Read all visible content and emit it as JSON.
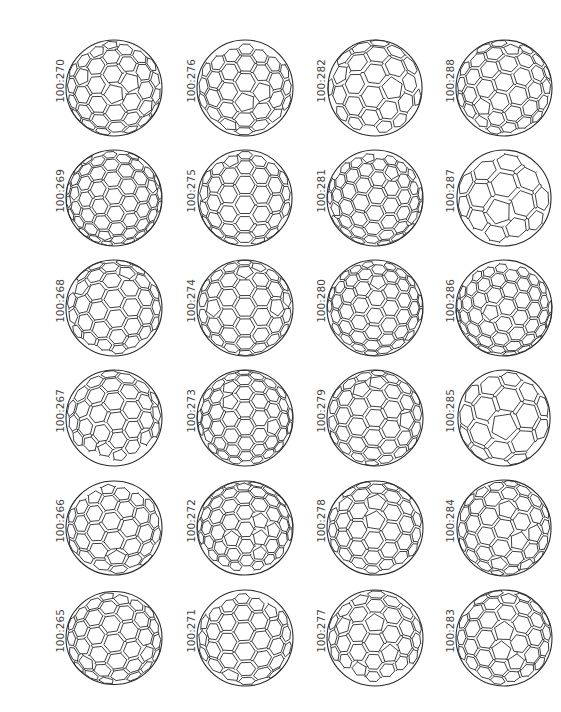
{
  "figure": {
    "title": "",
    "layout": {
      "columns": 4,
      "rows": 6
    },
    "line_color": "#2a2a2a",
    "label_color": "#444444",
    "cells": [
      {
        "label": "100:270",
        "col": 0,
        "row": 0,
        "seed": 270,
        "rx": 1.0,
        "ry": 1.0,
        "density": 7
      },
      {
        "label": "100:269",
        "col": 0,
        "row": 1,
        "seed": 269,
        "rx": 1.0,
        "ry": 1.0,
        "density": 8
      },
      {
        "label": "100:268",
        "col": 0,
        "row": 2,
        "seed": 268,
        "rx": 1.0,
        "ry": 1.0,
        "density": 7
      },
      {
        "label": "100:267",
        "col": 0,
        "row": 3,
        "seed": 267,
        "rx": 1.0,
        "ry": 1.0,
        "density": 7
      },
      {
        "label": "100:266",
        "col": 0,
        "row": 4,
        "seed": 266,
        "rx": 1.0,
        "ry": 0.98,
        "density": 7
      },
      {
        "label": "100:265",
        "col": 0,
        "row": 5,
        "seed": 265,
        "rx": 1.0,
        "ry": 0.97,
        "density": 7
      },
      {
        "label": "100:276",
        "col": 1,
        "row": 0,
        "seed": 276,
        "rx": 1.0,
        "ry": 1.0,
        "density": 7
      },
      {
        "label": "100:275",
        "col": 1,
        "row": 1,
        "seed": 275,
        "rx": 0.98,
        "ry": 1.0,
        "density": 7
      },
      {
        "label": "100:274",
        "col": 1,
        "row": 2,
        "seed": 274,
        "rx": 1.0,
        "ry": 1.0,
        "density": 7
      },
      {
        "label": "100:273",
        "col": 1,
        "row": 3,
        "seed": 273,
        "rx": 1.0,
        "ry": 1.0,
        "density": 8
      },
      {
        "label": "100:272",
        "col": 1,
        "row": 4,
        "seed": 272,
        "rx": 1.0,
        "ry": 0.98,
        "density": 8
      },
      {
        "label": "100:271",
        "col": 1,
        "row": 5,
        "seed": 271,
        "rx": 1.0,
        "ry": 1.0,
        "density": 7
      },
      {
        "label": "100:282",
        "col": 2,
        "row": 0,
        "seed": 282,
        "rx": 0.98,
        "ry": 1.0,
        "density": 6
      },
      {
        "label": "100:281",
        "col": 2,
        "row": 1,
        "seed": 281,
        "rx": 1.0,
        "ry": 1.0,
        "density": 8
      },
      {
        "label": "100:280",
        "col": 2,
        "row": 2,
        "seed": 280,
        "rx": 1.0,
        "ry": 1.0,
        "density": 8
      },
      {
        "label": "100:279",
        "col": 2,
        "row": 3,
        "seed": 279,
        "rx": 1.0,
        "ry": 1.0,
        "density": 7
      },
      {
        "label": "100:278",
        "col": 2,
        "row": 4,
        "seed": 278,
        "rx": 1.0,
        "ry": 0.98,
        "density": 7
      },
      {
        "label": "100:277",
        "col": 2,
        "row": 5,
        "seed": 277,
        "rx": 1.0,
        "ry": 1.0,
        "density": 7
      },
      {
        "label": "100:288",
        "col": 3,
        "row": 0,
        "seed": 288,
        "rx": 1.0,
        "ry": 1.0,
        "density": 7
      },
      {
        "label": "100:287",
        "col": 3,
        "row": 1,
        "seed": 287,
        "rx": 0.98,
        "ry": 1.0,
        "density": 5
      },
      {
        "label": "100:286",
        "col": 3,
        "row": 2,
        "seed": 286,
        "rx": 1.0,
        "ry": 1.0,
        "density": 8
      },
      {
        "label": "100:285",
        "col": 3,
        "row": 3,
        "seed": 285,
        "rx": 0.96,
        "ry": 1.0,
        "density": 5
      },
      {
        "label": "100:284",
        "col": 3,
        "row": 4,
        "seed": 284,
        "rx": 0.98,
        "ry": 1.0,
        "density": 7
      },
      {
        "label": "100:283",
        "col": 3,
        "row": 5,
        "seed": 283,
        "rx": 1.0,
        "ry": 1.0,
        "density": 7
      }
    ]
  }
}
